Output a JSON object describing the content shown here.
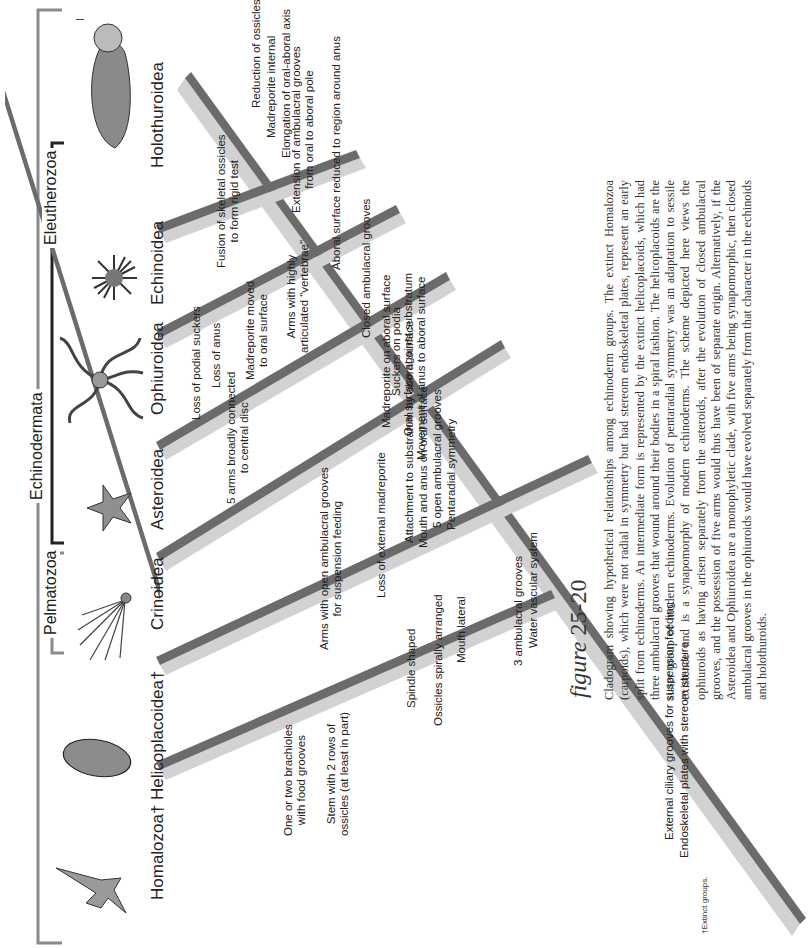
{
  "groups": {
    "echinodermata": "Echinodermata",
    "pelmatozoa": "Pelmatozoa",
    "eleutherozoa": "Eleutherozoa"
  },
  "taxa": [
    {
      "name": "Homalozoa†",
      "organism": "homalozoan-carpoid"
    },
    {
      "name": "Helicoplacoidea†",
      "organism": "helicoplacoid"
    },
    {
      "name": "Crinoidea",
      "organism": "crinoid"
    },
    {
      "name": "Asteroidea",
      "organism": "sea-star"
    },
    {
      "name": "Ophiuroidea",
      "organism": "brittle-star"
    },
    {
      "name": "Echinoidea",
      "organism": "sea-urchin"
    },
    {
      "name": "Holothuroidea",
      "organism": "sea-cucumber"
    }
  ],
  "branch_labels": {
    "homalozoa": [
      "One or two brachioles\nwith food grooves",
      "Stem with 2 rows of\nossicles (at least in part)"
    ],
    "helicoplacoidea": [
      "Spindle shaped",
      "Ossicles spirally arranged",
      "Mouth lateral"
    ],
    "crinoidea": [
      "Arms with open ambulacral grooves\nfor suspension feeding",
      "Loss of external madreporite"
    ],
    "asteroidea": [
      "5 arms broadly connected\nto central disc"
    ],
    "ophiuroidea": [
      "Loss of podial suckers",
      "Loss of anus",
      "Madreporite moved\nto oral surface",
      "Arms with highly\narticulated \"vertebrae\""
    ],
    "echinoidea": [
      "Fusion of skeletal ossicles\nto form rigid test"
    ],
    "holothuroidea": [
      "Reduction of ossicles",
      "Madreporite internal",
      "Elongation of oral-aboral axis"
    ]
  },
  "trunk_labels": [
    "External ciliary grooves for suspension feeding",
    "Endoskeletal plates with stereom structure",
    "3 ambulacral grooves",
    "Water vascular system",
    "Attachment to substratum by aboral surface",
    "Mouth and anus on oral surface",
    "5 open ambulacral grooves",
    "Pentaradial symmetry",
    "Madreporite on aboral surface",
    "Suckers on podia",
    "Oral surface against substratum",
    "Movement of anus to aboral surface",
    "Closed ambulacral grooves",
    "Extension of ambulacral grooves\nfrom oral to aboral pole",
    "Aboral surface reduced to region around anus"
  ],
  "figure": {
    "word": "figure",
    "number": "25-20",
    "caption": "Cladogram showing hypothetical relationships among echinoderm groups. The extinct Homalozoa (carpoids), which were not radial in symmetry but had stereom endoskeletal plates, represent an early split from echinoderms. An intermediate form is represented by the extinct helicoplacoids, which had three ambulacral grooves that wound around their bodies in a spiral fashion. The helicoplacoids are the sister group of modern echinoderms. Evolution of pentaradial symmetry was an adaptation to sessile existence and is a synapomorphy of modern echinoderms. The scheme depicted here views the ophiuroids as having arisen separately from the asteroids, after the evolution of closed ambulacral grooves, and the possession of five arms would thus have been of separate origin. Alternatively, if the Asteroidea and Ophiuroidea are a monophyletic clade, with five arms being synapomorphic, then closed ambulacral grooves in the ophiuroids would have evolved separately from that character in the echinoids and holothuroids."
  },
  "footnote": "†Extinct groups.",
  "colors": {
    "branch_dark": "#6b6b6b",
    "branch_light": "#d2d2d2",
    "bracket_gray": "#8a8a8a",
    "bracket_black": "#222222",
    "text": "#222222"
  }
}
